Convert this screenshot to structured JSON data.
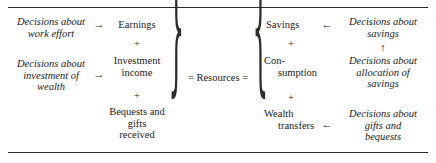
{
  "figure": {
    "title": "",
    "background_color": "#ffffff",
    "text_color": "#1a1a1a",
    "rule_color": "#2b2b2b"
  },
  "rules": {
    "top_label": "top-horizontal-rule",
    "bottom_label": "bottom-horizontal-rule"
  },
  "braces": {
    "left": "}",
    "right": "{"
  },
  "center": {
    "resources": "= Resources ="
  },
  "left_decisions": [
    {
      "line1": "Decisions about",
      "line2": "work effort"
    },
    {
      "line1": "Decisions about",
      "line2": "investment of",
      "line3": "wealth"
    }
  ],
  "sources": {
    "items": [
      {
        "line1": "Earnings"
      },
      {
        "line1": "Investment",
        "line2": "income"
      },
      {
        "line1": "Bequests and",
        "line2": "gifts",
        "line3": "received"
      }
    ],
    "operators": [
      "+",
      "+"
    ]
  },
  "uses": {
    "items": [
      {
        "line1": "Savings"
      },
      {
        "line1": "Con-",
        "line2": "sumption"
      },
      {
        "line1": "Wealth",
        "line2": "transfers"
      }
    ],
    "operators": [
      "+",
      "+"
    ]
  },
  "right_decisions": [
    {
      "line1": "Decisions about",
      "line2": "savings"
    },
    {
      "line1": "Decisions about",
      "line2": "allocation of",
      "line3": "savings"
    },
    {
      "line1": "Decisions about",
      "line2": "gifts and",
      "line3": "bequests"
    }
  ],
  "arrows": {
    "right_1": "→",
    "right_2": "→",
    "left_1": "←",
    "left_2": "←",
    "up_1": "↑"
  }
}
